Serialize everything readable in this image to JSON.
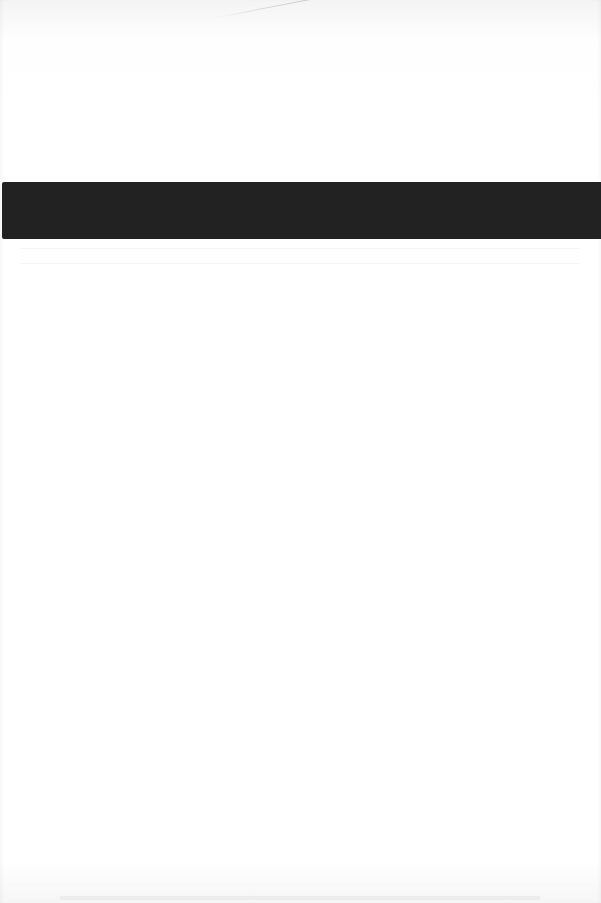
{
  "document": {
    "type": "scanned-page",
    "text_content": "",
    "redactions": [
      {
        "label": "redacted",
        "color": "#222222"
      }
    ]
  }
}
